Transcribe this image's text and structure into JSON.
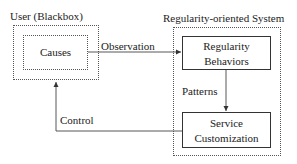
{
  "diagram": {
    "user_group": {
      "title": "User (Blackbox)",
      "inner_box": "Causes"
    },
    "system_group": {
      "title": "Regularity-oriented System",
      "boxes": [
        {
          "line1": "Regularity",
          "line2": "Behaviors"
        },
        {
          "line1": "Service",
          "line2": "Customization"
        }
      ]
    },
    "edges": [
      {
        "from": "Causes",
        "to": "Regularity Behaviors",
        "label": "Observation"
      },
      {
        "from": "Regularity Behaviors",
        "to": "Service Customization",
        "label": "Patterns"
      },
      {
        "from": "Service Customization",
        "to": "User (Blackbox)",
        "label": "Control"
      }
    ]
  }
}
